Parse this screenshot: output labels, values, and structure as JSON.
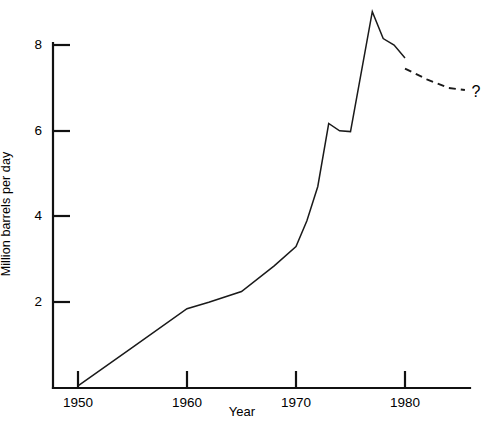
{
  "chart_data": {
    "type": "line",
    "title": "",
    "subtitle": "",
    "xlabel": "Year",
    "ylabel": "Million barrels per day",
    "xlim": [
      1948,
      1986
    ],
    "ylim": [
      0,
      8.9
    ],
    "grid": false,
    "legend": null,
    "x_ticks": [
      "1950",
      "1960",
      "1970",
      "1980"
    ],
    "x_tick_values": [
      1950,
      1960,
      1970,
      1980
    ],
    "y_ticks": [
      "2",
      "4",
      "6",
      "8"
    ],
    "y_tick_values": [
      2,
      4,
      6,
      8
    ],
    "series": [
      {
        "name": "Historical",
        "style": "solid",
        "x": [
          1950,
          1955,
          1960,
          1962,
          1965,
          1968,
          1970,
          1971,
          1972,
          1973,
          1974,
          1975,
          1977,
          1978,
          1979,
          1980
        ],
        "values": [
          0.05,
          0.95,
          1.85,
          2.0,
          2.25,
          2.85,
          3.3,
          3.9,
          4.7,
          6.17,
          6.0,
          5.98,
          8.78,
          8.15,
          8.0,
          7.7
        ]
      },
      {
        "name": "Projection",
        "style": "dashed",
        "x": [
          1980,
          1982,
          1984,
          1985.5
        ],
        "values": [
          7.45,
          7.2,
          7.0,
          6.95
        ]
      }
    ],
    "annotations": [
      {
        "name": "forecast-question-mark",
        "text": "?",
        "x": 1986,
        "y": 6.9
      }
    ]
  }
}
